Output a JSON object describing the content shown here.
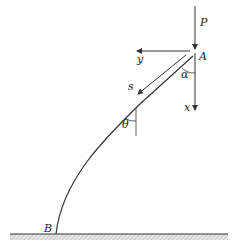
{
  "diagram": {
    "type": "elastica-column",
    "labels": {
      "load": "P",
      "top_point": "A",
      "bottom_point": "B",
      "y_axis": "y",
      "x_axis": "x",
      "arc_length": "s",
      "angle_alpha": "α",
      "angle_theta": "θ"
    },
    "colors": {
      "line": "#333333",
      "ground_hatch": "#bdbdbd",
      "background": "#ffffff"
    }
  }
}
